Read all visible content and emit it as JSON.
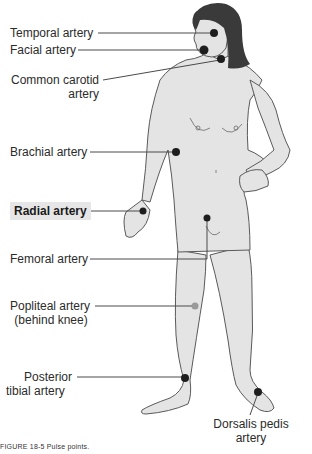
{
  "figure": {
    "caption": "FIGURE 18-5 Pulse points.",
    "colors": {
      "body_fill": "#e4e4e4",
      "outline": "#5a5a5a",
      "hair": "#3a3a3a",
      "pulse_dot": "#1e1e1e",
      "pulse_dot_hidden": "#9a9a9a",
      "leader_line": "#4a4a4a",
      "highlight_bg": "#e6e6e6"
    },
    "labels": {
      "temporal": "Temporal artery",
      "facial": "Facial artery",
      "carotid_line1": "Common carotid",
      "carotid_line2": "artery",
      "brachial": "Brachial artery",
      "radial": "Radial artery",
      "femoral": "Femoral artery",
      "popliteal_line1": "Popliteal artery",
      "popliteal_line2": "(behind knee)",
      "posterior_tibial_line1": "Posterior",
      "posterior_tibial_line2": "tibial artery",
      "dorsalis_pedis_line1": "Dorsalis pedis",
      "dorsalis_pedis_line2": "artery"
    },
    "highlighted_label": "Radial artery"
  }
}
